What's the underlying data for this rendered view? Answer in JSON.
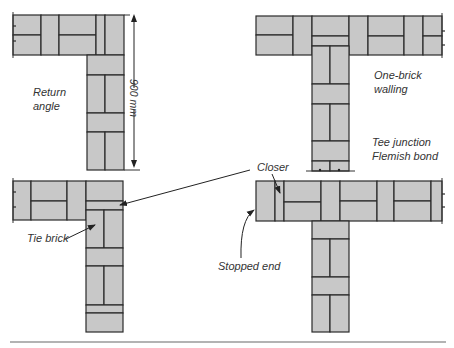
{
  "figure": {
    "colors": {
      "brick_fill": "#c8c8c8",
      "joint": "#2a2a2a",
      "text": "#333333",
      "rule": "#9a9a9a"
    },
    "labels": {
      "return_angle": [
        "Return",
        "angle"
      ],
      "dimension": "900 mm",
      "one_brick_walling": [
        "One-brick",
        "walling"
      ],
      "tee_junction": [
        "Tee junction",
        "Flemish bond"
      ],
      "closer": "Closer",
      "tie_brick": "Tie brick",
      "stopped_end": "Stopped end"
    },
    "panels": [
      {
        "id": "return-angle-course-1",
        "description": "Return angle, course 1"
      },
      {
        "id": "tee-junction-course-1",
        "description": "Tee junction, course 1"
      },
      {
        "id": "return-angle-course-2",
        "description": "Return angle, course 2"
      },
      {
        "id": "tee-junction-course-2",
        "description": "Tee junction, course 2"
      }
    ]
  }
}
